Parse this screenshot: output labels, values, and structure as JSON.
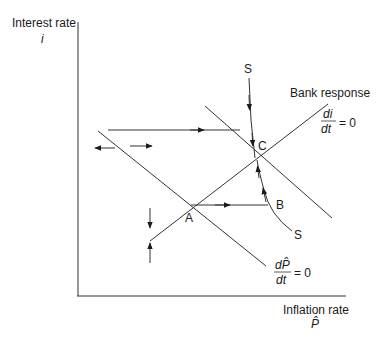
{
  "axes": {
    "y_label": "Interest rate",
    "y_symbol": "i",
    "x_label": "Inflation rate",
    "x_symbol": "P̂"
  },
  "curves": {
    "bank_response": {
      "label": "Bank response",
      "eq_num": "di",
      "eq_den": "dt",
      "eq_rhs": "= 0"
    },
    "inflation_locus": {
      "eq_num": "dP̂",
      "eq_den": "dt",
      "eq_rhs": "= 0"
    }
  },
  "points": {
    "A": "A",
    "B": "B",
    "C": "C",
    "S_top": "S",
    "S_bottom": "S"
  },
  "colors": {
    "line": "#2a2a2a",
    "background": "#ffffff"
  }
}
